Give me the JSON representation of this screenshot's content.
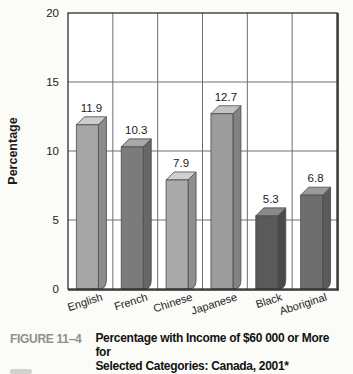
{
  "figure": {
    "label": "FIGURE 11–4",
    "title_line1": "Percentage with Income of $60 000 or More for",
    "title_line2": "Selected Categories: Canada, 2001*"
  },
  "chart_data": {
    "type": "bar",
    "style": "3d-extruded-bars",
    "title": "",
    "xlabel": "",
    "ylabel": "Percentage",
    "categories": [
      "English",
      "French",
      "Chinese",
      "Japanese",
      "Black",
      "Aboriginal"
    ],
    "values": [
      11.9,
      10.3,
      7.9,
      12.7,
      5.3,
      6.8
    ],
    "value_labels": [
      "11.9",
      "10.3",
      "7.9",
      "12.7",
      "5.3",
      "6.8"
    ],
    "ylim": [
      0,
      20
    ],
    "yticks": [
      0,
      5,
      10,
      15,
      20
    ],
    "ytick_labels": [
      "0",
      "5",
      "10",
      "15",
      "20"
    ],
    "grid": true,
    "legend": "none",
    "colors": {
      "frame": "#2e2e2e",
      "gridline": "#6e6e6e",
      "plot_bg": "#ffffff",
      "text": "#1a1a1a",
      "figure_label": "#8f8f8f",
      "bar_outline": "#4a4a4a"
    },
    "bar_colors": [
      {
        "front": "#a6a6a6",
        "side": "#8c8c8c",
        "top": "#cccccc"
      },
      {
        "front": "#7b7b7b",
        "side": "#676767",
        "top": "#a8a8a8"
      },
      {
        "front": "#aaaaaa",
        "side": "#8f8f8f",
        "top": "#cfcfcf"
      },
      {
        "front": "#9c9c9c",
        "side": "#828282",
        "top": "#c3c3c3"
      },
      {
        "front": "#5a5a5a",
        "side": "#4a4a4a",
        "top": "#8a8a8a"
      },
      {
        "front": "#6e6e6e",
        "side": "#5a5a5a",
        "top": "#9a9a9a"
      }
    ]
  }
}
